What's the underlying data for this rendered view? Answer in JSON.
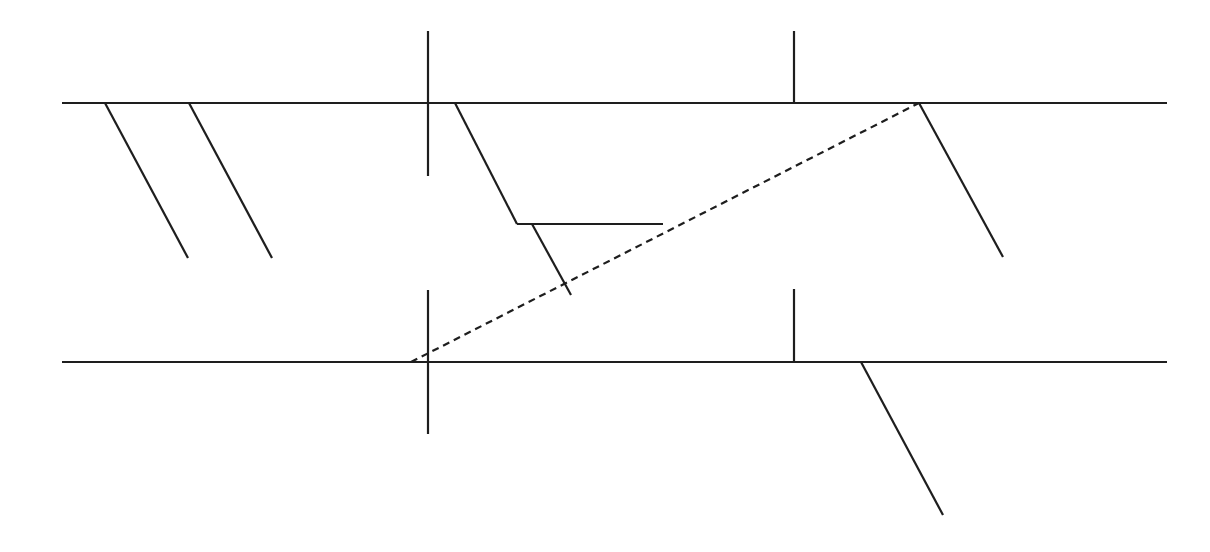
{
  "diagram": {
    "type": "line-diagram",
    "background": "#ffffff",
    "stroke_color": "#1e1e1e",
    "stroke_width": 2.2,
    "dash_pattern": "7,5",
    "horizontal_lines": [
      {
        "id": "top-line",
        "x1": 62,
        "y1": 103,
        "x2": 1167,
        "y2": 103
      },
      {
        "id": "bottom-line",
        "x1": 62,
        "y1": 362,
        "x2": 1167,
        "y2": 362
      }
    ],
    "vertical_lines": [
      {
        "id": "left-vertical-upper",
        "x1": 428,
        "y1": 31,
        "x2": 428,
        "y2": 176
      },
      {
        "id": "left-vertical-lower",
        "x1": 428,
        "y1": 290,
        "x2": 428,
        "y2": 434
      },
      {
        "id": "right-tick-upper",
        "x1": 794,
        "y1": 31,
        "x2": 794,
        "y2": 103
      },
      {
        "id": "right-tick-lower",
        "x1": 794,
        "y1": 289,
        "x2": 794,
        "y2": 362
      }
    ],
    "diagonal_lines": [
      {
        "id": "diag-left-1",
        "x1": 105,
        "y1": 103,
        "x2": 188,
        "y2": 258
      },
      {
        "id": "diag-left-2",
        "x1": 189,
        "y1": 103,
        "x2": 272,
        "y2": 258
      },
      {
        "id": "diag-mid",
        "x1": 455,
        "y1": 103,
        "x2": 517,
        "y2": 224
      },
      {
        "id": "diag-mid-short",
        "x1": 532,
        "y1": 224,
        "x2": 571,
        "y2": 295
      },
      {
        "id": "diag-right-upper",
        "x1": 919,
        "y1": 103,
        "x2": 1003,
        "y2": 257
      },
      {
        "id": "diag-right-lower",
        "x1": 861,
        "y1": 362,
        "x2": 943,
        "y2": 515
      }
    ],
    "other_solid_lines": [
      {
        "id": "mid-horizontal-step",
        "x1": 517,
        "y1": 224,
        "x2": 663,
        "y2": 224
      }
    ],
    "dashed_lines": [
      {
        "id": "dashed-connector",
        "x1": 411,
        "y1": 362,
        "x2": 919,
        "y2": 103
      }
    ]
  }
}
